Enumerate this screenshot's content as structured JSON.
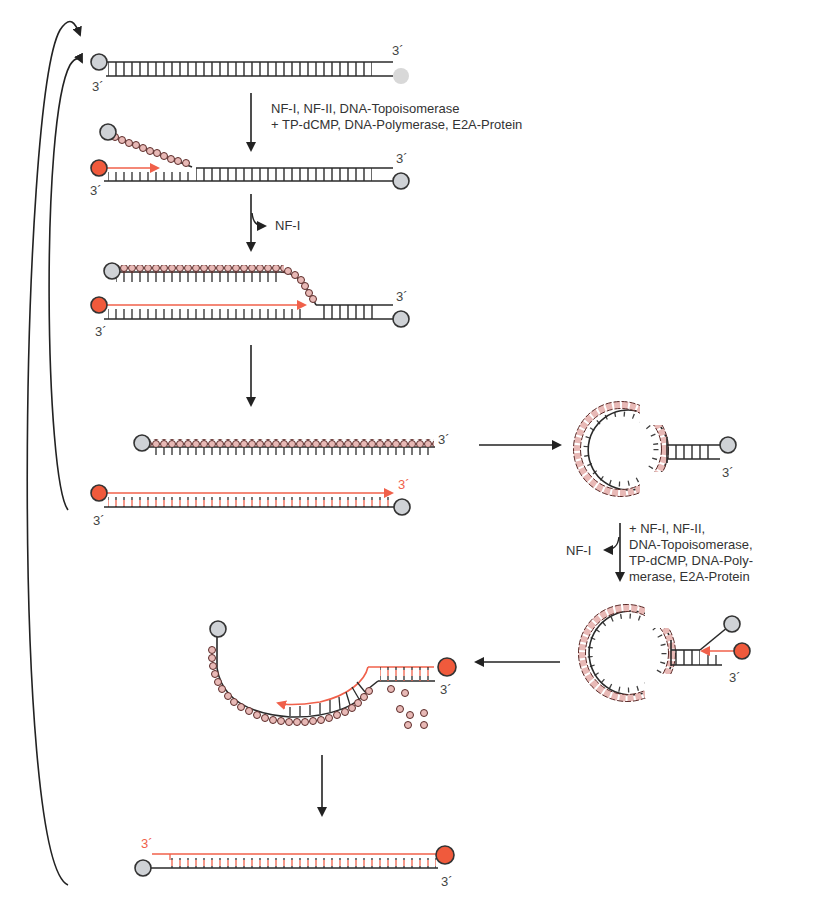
{
  "colors": {
    "strand": "#2a2a2a",
    "new_strand": "#f0604a",
    "terminal_protein_gray": "#cfd2d6",
    "terminal_protein_red": "#f05a3c",
    "dbp_bead_fill": "#e8b9b6",
    "dbp_bead_stroke": "#5a2a28",
    "arrow": "#222222"
  },
  "labels": {
    "end_3prime": "3´",
    "step1_line1": "NF-I, NF-II, DNA-Topoisomerase",
    "step1_line2": "+ TP-dCMP, DNA-Polymerase, E2A-Protein",
    "step2_release": "NF-I",
    "step5_line1": "+ NF-I, NF-II,",
    "step5_line2": "DNA-Topoisomerase,",
    "step5_line3": "TP-dCMP, DNA-Poly-",
    "step5_line4": "merase, E2A-Protein",
    "step5_release": "NF-I"
  },
  "stages": [
    {
      "id": "template-duplex",
      "description": "Parental double-stranded DNA with terminal proteins at 5' ends"
    },
    {
      "id": "initiation",
      "description": "Protein-primed initiation, displaced strand coated with E2A"
    },
    {
      "id": "elongation",
      "description": "Strand displacement synthesis"
    },
    {
      "id": "products",
      "description": "Daughter duplex plus displaced single strand coated with E2A"
    },
    {
      "id": "panhandle",
      "description": "Single strand forms panhandle via inverted terminal repeats"
    },
    {
      "id": "panhandle-initiation",
      "description": "Initiation on panhandle"
    },
    {
      "id": "panhandle-elongation",
      "description": "Synthesis displaces E2A proteins"
    },
    {
      "id": "final-duplex",
      "description": "Second daughter duplex"
    }
  ]
}
